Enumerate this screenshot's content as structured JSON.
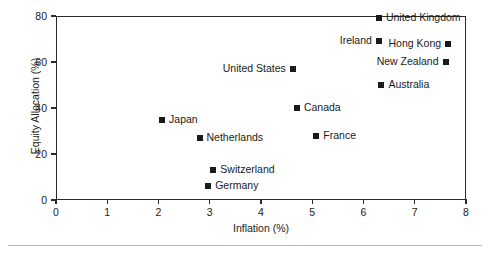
{
  "chart_data": {
    "type": "scatter",
    "title": "",
    "xlabel": "Inflation (%)",
    "ylabel": "Equity Allocation (%)",
    "xlim": [
      0,
      8
    ],
    "ylim": [
      0,
      80
    ],
    "xticks": [
      "0",
      "1",
      "2",
      "3",
      "4",
      "5",
      "6",
      "7",
      "8"
    ],
    "yticks": [
      "0",
      "20",
      "40",
      "60",
      "80"
    ],
    "grid": false,
    "legend": "none",
    "marker_color": "#1a1a1a",
    "frame_color": "#2b2b2b",
    "points": [
      {
        "label": "United Kingdom",
        "x": 6.3,
        "y": 79,
        "label_side": "right"
      },
      {
        "label": "Ireland",
        "x": 6.3,
        "y": 69,
        "label_side": "left"
      },
      {
        "label": "Hong Kong",
        "x": 7.65,
        "y": 68,
        "label_side": "left"
      },
      {
        "label": "New Zealand",
        "x": 7.6,
        "y": 60,
        "label_side": "left"
      },
      {
        "label": "United States",
        "x": 4.62,
        "y": 57,
        "label_side": "left"
      },
      {
        "label": "Australia",
        "x": 6.35,
        "y": 50,
        "label_side": "right"
      },
      {
        "label": "Canada",
        "x": 4.7,
        "y": 40,
        "label_side": "right"
      },
      {
        "label": "Japan",
        "x": 2.07,
        "y": 35,
        "label_side": "right"
      },
      {
        "label": "France",
        "x": 5.08,
        "y": 28,
        "label_side": "right"
      },
      {
        "label": "Netherlands",
        "x": 2.8,
        "y": 27,
        "label_side": "right"
      },
      {
        "label": "Switzerland",
        "x": 3.07,
        "y": 13,
        "label_side": "right"
      },
      {
        "label": "Germany",
        "x": 2.97,
        "y": 6,
        "label_side": "right"
      }
    ]
  }
}
